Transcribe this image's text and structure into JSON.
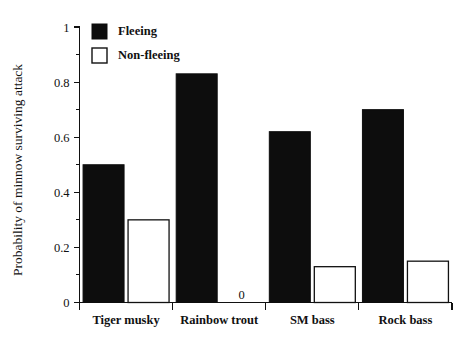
{
  "chart_data": {
    "type": "bar",
    "title": "",
    "xlabel": "",
    "ylabel": "Probability of minnow surviving attack",
    "categories": [
      "Tiger musky",
      "Rainbow trout",
      "SM bass",
      "Rock bass"
    ],
    "series": [
      {
        "name": "Fleeing",
        "style": "filled",
        "values": [
          0.5,
          0.83,
          0.62,
          0.7
        ]
      },
      {
        "name": "Non-fleeing",
        "style": "open",
        "values": [
          0.3,
          0.0,
          0.13,
          0.15
        ]
      }
    ],
    "ylim": [
      0,
      1
    ],
    "y_major_ticks": [
      0,
      0.2,
      0.4,
      0.6,
      0.8,
      1
    ],
    "y_major_tick_labels": [
      "0",
      "0.2",
      "0.4",
      "0.6",
      "0.8",
      "1"
    ],
    "y_minor_ticks": [
      0.1,
      0.3,
      0.5,
      0.7,
      0.9
    ],
    "grid": false,
    "legend_position": "top-left-inside",
    "annotations": [
      {
        "text": "0",
        "category": "Rainbow trout",
        "series": "Non-fleeing",
        "value": 0
      }
    ],
    "colors": {
      "fleeing": "#0d0d0d",
      "non_fleeing_fill": "#ffffff",
      "non_fleeing_stroke": "#111111",
      "axis": "#111111",
      "background": "#ffffff"
    }
  },
  "legend": {
    "items": [
      {
        "label": "Fleeing",
        "style": "filled"
      },
      {
        "label": "Non-fleeing",
        "style": "open"
      }
    ]
  }
}
